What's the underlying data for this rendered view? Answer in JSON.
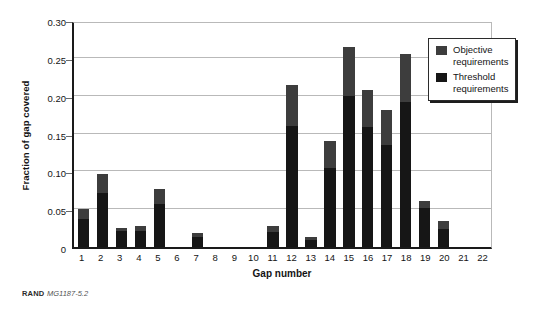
{
  "chart_data": {
    "type": "bar",
    "stacked": true,
    "title": "",
    "subtitle": "",
    "xlabel": "Gap number",
    "ylabel": "Fraction of gap covered",
    "categories": [
      "1",
      "2",
      "3",
      "4",
      "5",
      "6",
      "7",
      "8",
      "9",
      "10",
      "11",
      "12",
      "13",
      "14",
      "15",
      "16",
      "17",
      "18",
      "19",
      "20",
      "21",
      "22"
    ],
    "series": [
      {
        "name": "Threshold requirements",
        "color": "#161616",
        "values": [
          0.037,
          0.072,
          0.021,
          0.021,
          0.057,
          0.0,
          0.013,
          0.0,
          0.0,
          0.0,
          0.02,
          0.16,
          0.009,
          0.104,
          0.2,
          0.158,
          0.135,
          0.192,
          0.052,
          0.024,
          0.0,
          0.0
        ]
      },
      {
        "name": "Objective requirements",
        "color": "#3d3d3d",
        "values": [
          0.013,
          0.024,
          0.004,
          0.007,
          0.02,
          0.0,
          0.005,
          0.0,
          0.0,
          0.0,
          0.008,
          0.054,
          0.004,
          0.036,
          0.065,
          0.05,
          0.046,
          0.063,
          0.009,
          0.01,
          0.0,
          0.0
        ]
      }
    ],
    "totals": [
      0.05,
      0.096,
      0.025,
      0.028,
      0.077,
      0.0,
      0.018,
      0.0,
      0.0,
      0.0,
      0.028,
      0.214,
      0.013,
      0.14,
      0.265,
      0.208,
      0.181,
      0.255,
      0.061,
      0.034,
      0.0,
      0.0
    ],
    "ylim": [
      0,
      0.3
    ],
    "yticks": [
      0,
      0.05,
      0.1,
      0.15,
      0.2,
      0.25,
      0.3
    ],
    "ytick_labels": [
      "0",
      "0.05",
      "0.10",
      "0.15",
      "0.20",
      "0.25",
      "0.30"
    ],
    "grid": "horizontal",
    "legend_position": "top-right"
  },
  "legend": {
    "entries": [
      {
        "label_line1": "Objective",
        "label_line2": "requirements",
        "swatch": "objective-swatch"
      },
      {
        "label_line1": "Threshold",
        "label_line2": "requirements",
        "swatch": "threshold-swatch"
      }
    ]
  },
  "source": {
    "organization": "RAND",
    "document_id": "MG1187-5.2"
  }
}
